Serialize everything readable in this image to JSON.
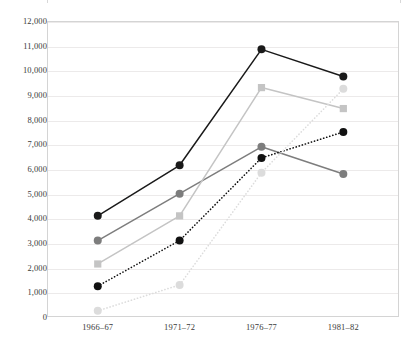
{
  "chart_data": {
    "type": "line",
    "title": "",
    "xlabel": "",
    "ylabel": "Number of Students in Thousands",
    "categories": [
      "1966–67",
      "1971–72",
      "1976–77",
      "1981–82"
    ],
    "ylim": [
      0,
      12000
    ],
    "ytick_step": 1000,
    "yticks": [
      "0",
      "1,000",
      "2,000",
      "3,000",
      "4,000",
      "5,000",
      "6,000",
      "7,000",
      "8,000",
      "9,000",
      "10,000",
      "11,000",
      "12,000"
    ],
    "ytick_values": [
      0,
      1000,
      2000,
      3000,
      4000,
      5000,
      6000,
      7000,
      8000,
      9000,
      10000,
      11000,
      12000
    ],
    "grid": true,
    "legend_position": "none",
    "series": [
      {
        "name": "series-1",
        "color": "#1a1a1a",
        "style": "solid",
        "marker": "circle",
        "values": [
          4100,
          6150,
          10850,
          9750
        ]
      },
      {
        "name": "series-2",
        "color": "#7d7d7d",
        "style": "solid",
        "marker": "circle",
        "values": [
          3100,
          5000,
          6900,
          5800
        ]
      },
      {
        "name": "series-3",
        "color": "#c4c4c4",
        "style": "solid",
        "marker": "square",
        "values": [
          2150,
          4100,
          9300,
          8450
        ]
      },
      {
        "name": "series-4",
        "color": "#111111",
        "style": "dotted",
        "marker": "circle",
        "values": [
          1250,
          3100,
          6450,
          7500
        ]
      },
      {
        "name": "series-5",
        "color": "#dcdcdc",
        "style": "dotted",
        "marker": "circle",
        "values": [
          250,
          1300,
          5850,
          9250
        ]
      }
    ]
  }
}
